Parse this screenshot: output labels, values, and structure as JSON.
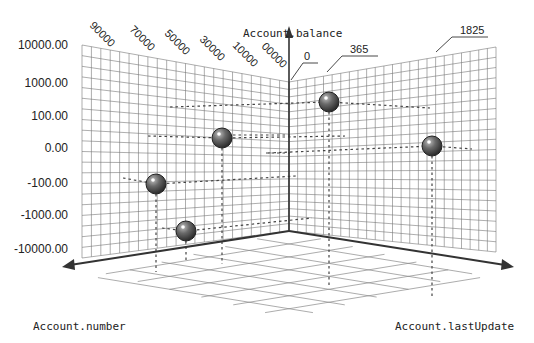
{
  "chart_data": {
    "type": "scatter",
    "subtype": "3d-scatter",
    "title": "",
    "axes": {
      "vertical": {
        "label": "Account.balance",
        "scale": "log-symmetric",
        "ticks": [
          "10000.00",
          "1000.00",
          "100.00",
          "0.00",
          "-100.00",
          "-1000.00",
          "-10000.00"
        ]
      },
      "left_depth": {
        "label": "Account.number",
        "ticks": [
          "90000",
          "70000",
          "50000",
          "30000",
          "10000",
          "00000"
        ]
      },
      "right_depth": {
        "label": "Account.lastUpdate",
        "ticks": [
          "0",
          "365",
          "1825"
        ]
      }
    },
    "points": [
      {
        "account_number": 70000,
        "last_update": 200,
        "balance": -100
      },
      {
        "account_number": 60000,
        "last_update": 100,
        "balance": -10000
      },
      {
        "account_number": 40000,
        "last_update": 300,
        "balance": 10
      },
      {
        "account_number": 20000,
        "last_update": 400,
        "balance": 500
      },
      {
        "account_number": 5000,
        "last_update": 1500,
        "balance": 0
      }
    ],
    "grid": true,
    "legend": null
  },
  "labels": {
    "y_axis_title": "Account.balance",
    "left_axis_title": "Account.number",
    "right_axis_title": "Account.lastUpdate",
    "y_ticks": [
      "10000.00",
      "1000.00",
      "100.00",
      "0.00",
      "-100.00",
      "-1000.00",
      "-10000.00"
    ],
    "left_ticks": [
      "90000",
      "70000",
      "50000",
      "30000",
      "10000",
      "00000"
    ],
    "right_ticks": [
      "0",
      "365",
      "1825"
    ]
  },
  "colors": {
    "sphere": "#555555",
    "sphere_highlight": "#ffffff",
    "grid": "#777777",
    "axis": "#333333"
  }
}
